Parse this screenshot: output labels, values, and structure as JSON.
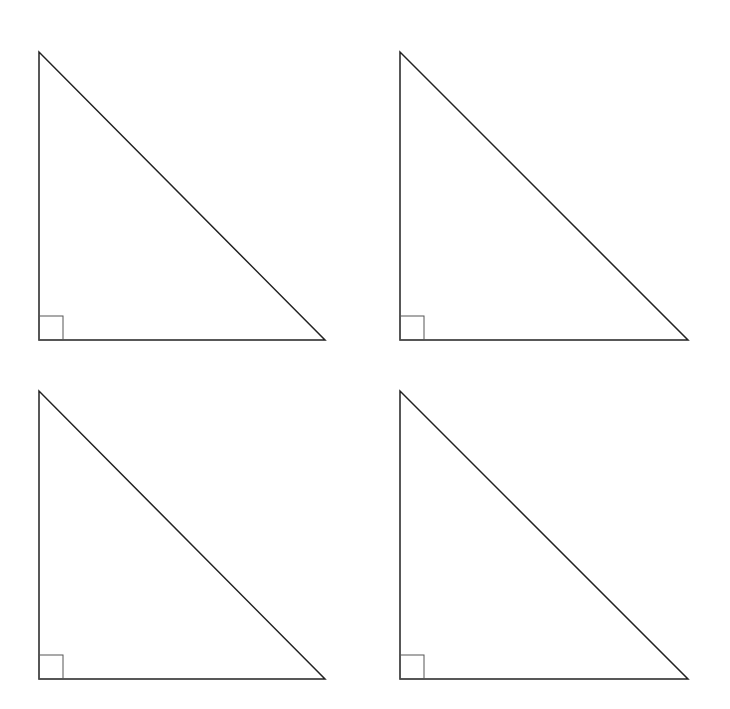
{
  "diagram": {
    "type": "right-triangles",
    "count": 4,
    "colors": {
      "stroke": "#222222",
      "marker": "#555555",
      "background": "#ffffff"
    },
    "triangles": [
      {
        "id": "top-left",
        "vertices": [
          [
            39,
            52
          ],
          [
            39,
            340
          ],
          [
            325,
            340
          ]
        ],
        "right_angle_box": {
          "x": 39,
          "y": 316,
          "size": 24
        }
      },
      {
        "id": "top-right",
        "vertices": [
          [
            400,
            52
          ],
          [
            400,
            340
          ],
          [
            688,
            340
          ]
        ],
        "right_angle_box": {
          "x": 400,
          "y": 316,
          "size": 24
        }
      },
      {
        "id": "bottom-left",
        "vertices": [
          [
            39,
            391
          ],
          [
            39,
            679
          ],
          [
            325,
            679
          ]
        ],
        "right_angle_box": {
          "x": 39,
          "y": 655,
          "size": 24
        }
      },
      {
        "id": "bottom-right",
        "vertices": [
          [
            400,
            391
          ],
          [
            400,
            679
          ],
          [
            688,
            679
          ]
        ],
        "right_angle_box": {
          "x": 400,
          "y": 655,
          "size": 24
        }
      }
    ]
  }
}
